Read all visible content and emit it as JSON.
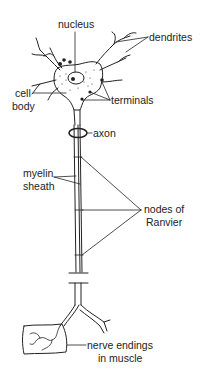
{
  "diagram": {
    "labels": {
      "nucleus": "nucleus",
      "dendrites": "dendrites",
      "cell_body_line1": "cell",
      "cell_body_line2": "body",
      "terminals": "terminals",
      "axon": "axon",
      "myelin_line1": "myelin",
      "myelin_line2": "sheath",
      "nodes_line1": "nodes of",
      "nodes_line2": "Ranvier",
      "nerve_line1": "nerve endings",
      "nerve_line2": "in muscle"
    },
    "colors": {
      "ink": "#222222",
      "background": "#ffffff"
    }
  }
}
